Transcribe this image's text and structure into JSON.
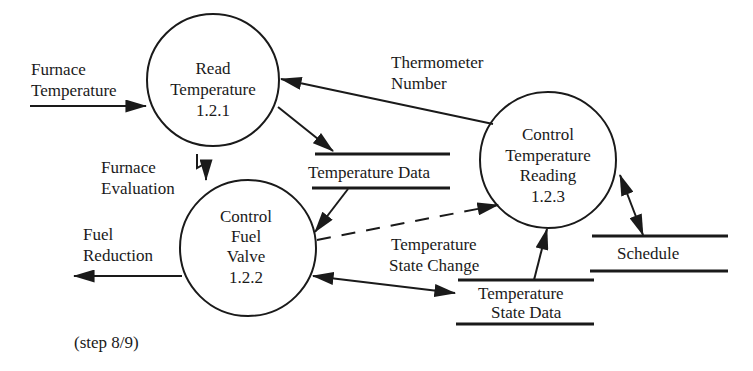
{
  "diagram": {
    "type": "data-flow-diagram",
    "processes": [
      {
        "id": "p1",
        "lines": [
          "Read",
          "Temperature",
          "1.2.1"
        ],
        "cx": 213,
        "cy": 80,
        "r": 66
      },
      {
        "id": "p2",
        "lines": [
          "Control",
          "Fuel",
          "Valve",
          "1.2.2"
        ],
        "cx": 248,
        "cy": 248,
        "r": 68
      },
      {
        "id": "p3",
        "lines": [
          "Control",
          "Temperature",
          "Reading",
          "1.2.3"
        ],
        "cx": 548,
        "cy": 160,
        "r": 68
      }
    ],
    "stores": [
      {
        "id": "s1",
        "label": "Temperature Data"
      },
      {
        "id": "s2",
        "label": "Schedule"
      },
      {
        "id": "s3",
        "lines": [
          "Temperature",
          "State Data"
        ]
      }
    ],
    "flows": [
      {
        "lines": [
          "Furnace",
          "Temperature"
        ]
      },
      {
        "lines": [
          "Furnace",
          "Evaluation"
        ]
      },
      {
        "lines": [
          "Fuel",
          "Reduction"
        ]
      },
      {
        "lines": [
          "Thermometer",
          "Number"
        ]
      },
      {
        "lines": [
          "Temperature",
          "State Change"
        ]
      }
    ],
    "footer": "(step 8/9)",
    "colors": {
      "stroke": "#1a1a1a",
      "background": "#ffffff"
    }
  }
}
